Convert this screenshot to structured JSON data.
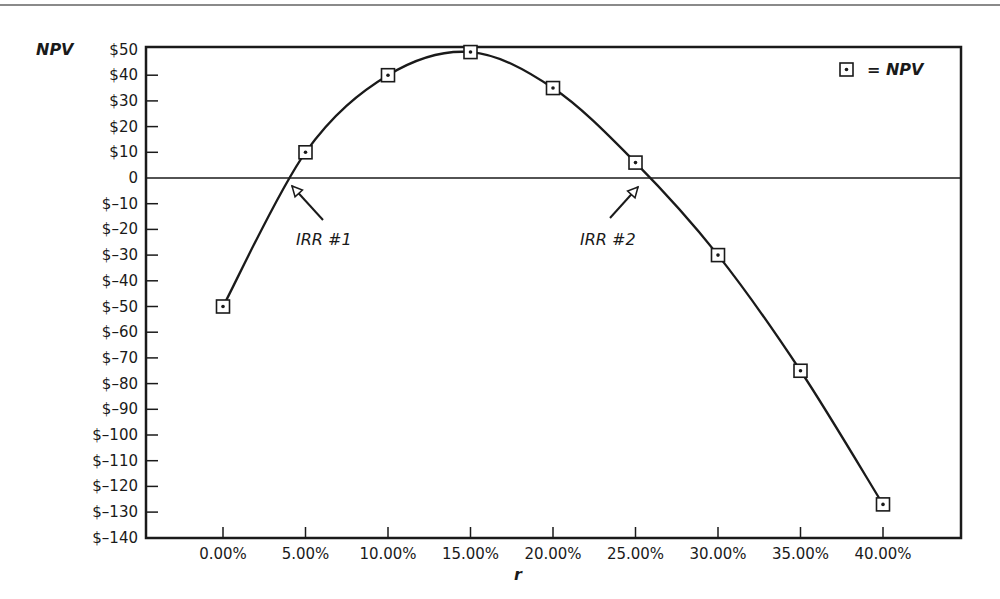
{
  "chart_data": {
    "type": "line",
    "title": "",
    "xlabel": "r",
    "ylabel": "NPV",
    "x": [
      0,
      5,
      10,
      15,
      20,
      25,
      30,
      35,
      40
    ],
    "categories": [
      "0.00%",
      "5.00%",
      "10.00%",
      "15.00%",
      "20.00%",
      "25.00%",
      "30.00%",
      "35.00%",
      "40.00%"
    ],
    "series": [
      {
        "name": "NPV",
        "values": [
          -50,
          10,
          40,
          49,
          35,
          6,
          -30,
          -75,
          -127
        ]
      }
    ],
    "ylim": [
      -140,
      50
    ],
    "yticks": [
      50,
      40,
      30,
      20,
      10,
      0,
      -10,
      -20,
      -30,
      -40,
      -50,
      -60,
      -70,
      -80,
      -90,
      -100,
      -110,
      -120,
      -130,
      -140
    ],
    "ytick_labels": [
      "$50",
      "$40",
      "$30",
      "$20",
      "$10",
      "0",
      "$–10",
      "$–20",
      "$–30",
      "$–40",
      "$–50",
      "$–60",
      "$–70",
      "$–80",
      "$–90",
      "$–100",
      "$–110",
      "$–120",
      "$–130",
      "$–140"
    ],
    "grid": false,
    "zero_line": true,
    "legend": {
      "position": "top-right",
      "marker": "boxed-dot",
      "label": "= NPV"
    },
    "annotations": [
      {
        "text": "IRR #1",
        "approx_r": 3.9,
        "points_to": "first zero crossing"
      },
      {
        "text": "IRR #2",
        "approx_r": 25.5,
        "points_to": "second zero crossing"
      }
    ]
  },
  "labels": {
    "y_axis_title": "NPV",
    "x_axis_title": "r",
    "legend_text": "= NPV",
    "irr1": "IRR #1",
    "irr2": "IRR #2"
  }
}
